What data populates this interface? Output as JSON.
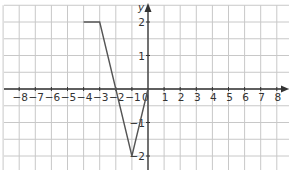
{
  "chart_data": {
    "type": "line",
    "title": "",
    "xlabel": "",
    "ylabel": "y",
    "xlim": [
      -9,
      8.5
    ],
    "ylim": [
      -2.5,
      2.5
    ],
    "grid": true,
    "x_ticks": [
      -8,
      -7,
      -6,
      -5,
      -4,
      -3,
      -2,
      -1,
      0,
      1,
      2,
      3,
      4,
      5,
      6,
      7,
      8
    ],
    "x_tick_labels": [
      "−8",
      "−7",
      "−6",
      "−5",
      "−4",
      "−3",
      "−2",
      "−1",
      "0",
      "1",
      "2",
      "3",
      "4",
      "5",
      "6",
      "7",
      "8"
    ],
    "y_ticks": [
      2,
      1,
      -1,
      -2
    ],
    "y_tick_labels": [
      "2",
      "1",
      "−1",
      "−2"
    ],
    "series": [
      {
        "name": "graph",
        "x": [
          -4,
          -3,
          -1,
          0
        ],
        "y": [
          2,
          2,
          -2,
          0
        ]
      }
    ]
  },
  "colors": {
    "grid": "#c8c8c8",
    "axis": "#333333",
    "line": "#555555",
    "background": "#ffffff"
  }
}
